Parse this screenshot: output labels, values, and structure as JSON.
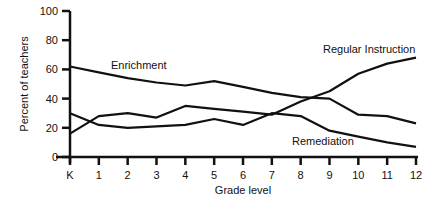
{
  "chart_data": {
    "type": "line",
    "title": "",
    "xlabel": "Grade level",
    "ylabel": "Percent of teachers",
    "ylim": [
      0,
      100
    ],
    "yticks": [
      0,
      20,
      40,
      60,
      80,
      100
    ],
    "grid": false,
    "legend": "inline labels",
    "categories": [
      "K",
      "1",
      "2",
      "3",
      "4",
      "5",
      "6",
      "7",
      "8",
      "9",
      "10",
      "11",
      "12"
    ],
    "series": [
      {
        "name": "Enrichment",
        "values": [
          62,
          58,
          54,
          51,
          49,
          52,
          48,
          44,
          41,
          40,
          29,
          28,
          23
        ]
      },
      {
        "name": "Regular Instruction",
        "values": [
          16,
          28,
          30,
          27,
          35,
          33,
          31,
          29,
          38,
          45,
          57,
          64,
          68
        ]
      },
      {
        "name": "Remediation",
        "values": [
          30,
          22,
          20,
          21,
          22,
          26,
          22,
          30,
          28,
          18,
          14,
          10,
          7
        ]
      }
    ]
  }
}
